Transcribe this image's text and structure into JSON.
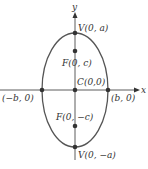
{
  "diagram": {
    "type": "ellipse-vertical-major-axis",
    "axes": {
      "x_label": "x",
      "y_label": "y"
    },
    "points": {
      "v_top": "V(0, a)",
      "f_top": "F(0, c)",
      "center": "C(0,0)",
      "left": "(−b, 0)",
      "right": "(b, 0)",
      "f_bottom": "F(0, −c)",
      "v_bottom": "V(0, −a)"
    },
    "colors": {
      "curve": "#555555",
      "axis": "#333333",
      "point": "#333333"
    }
  }
}
